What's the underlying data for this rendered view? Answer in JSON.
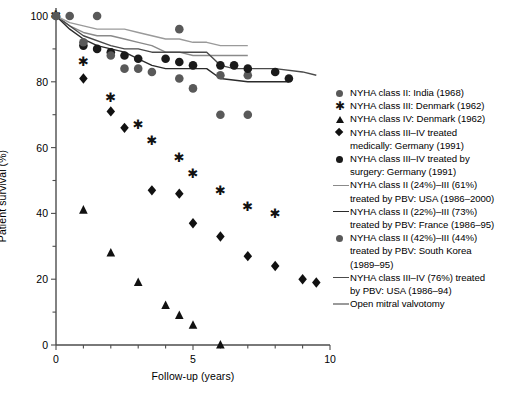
{
  "chart_data": {
    "type": "scatter",
    "title": "",
    "xlabel": "Follow-up (years)",
    "ylabel": "Patient survival (%)",
    "xlim": [
      0,
      10
    ],
    "ylim": [
      0,
      100
    ],
    "xticks": [
      0,
      5,
      10
    ],
    "yticks": [
      0,
      20,
      40,
      60,
      80,
      100
    ],
    "xminor_step": 1,
    "yminor_step": 10,
    "grid": false,
    "legend_position": "right",
    "series": [
      {
        "name": "NYHA class II: India (1968)",
        "label": "NYHA class II: India (1968)",
        "marker": "circle",
        "color": "#595959",
        "style": "markers",
        "points": [
          [
            0,
            100
          ],
          [
            0.5,
            100
          ],
          [
            1.5,
            100
          ],
          [
            4.5,
            96
          ],
          [
            6,
            82
          ],
          [
            7,
            82
          ]
        ]
      },
      {
        "name": "NYHA class III: Denmark (1962)",
        "label": "NYHA class III: Denmark (1962)",
        "marker": "star",
        "color": "#111111",
        "style": "markers",
        "points": [
          [
            0,
            100
          ],
          [
            1,
            86
          ],
          [
            2,
            75
          ],
          [
            3,
            67
          ],
          [
            3.5,
            62
          ],
          [
            4.5,
            57
          ],
          [
            5,
            52
          ],
          [
            6,
            47
          ],
          [
            7,
            42
          ],
          [
            8,
            40
          ]
        ]
      },
      {
        "name": "NYHA class IV: Denmark (1962)",
        "label": "NYHA class IV: Denmark (1962)",
        "marker": "triangle",
        "color": "#111111",
        "style": "markers",
        "points": [
          [
            1,
            41
          ],
          [
            2,
            28
          ],
          [
            3,
            19
          ],
          [
            4,
            12
          ],
          [
            4.5,
            9
          ],
          [
            5,
            6
          ],
          [
            6,
            0
          ]
        ]
      },
      {
        "name": "NYHA class III-IV treated medically: Germany (1991)",
        "label": "NYHA class III–IV treated\nmedically: Germany (1991)",
        "marker": "diamond",
        "color": "#111111",
        "style": "markers",
        "points": [
          [
            1,
            81
          ],
          [
            2,
            71
          ],
          [
            2.5,
            66
          ],
          [
            3.5,
            47
          ],
          [
            4.5,
            46
          ],
          [
            5,
            37
          ],
          [
            6,
            33
          ],
          [
            7,
            27
          ],
          [
            8,
            24
          ],
          [
            9,
            20
          ],
          [
            9.5,
            19
          ]
        ]
      },
      {
        "name": "NYHA class III-IV treated by surgery: Germany (1991)",
        "label": "NYHA class III–IV treated by\nsurgery: Germany (1991)",
        "marker": "circle",
        "color": "#1a1a1a",
        "style": "markers",
        "points": [
          [
            1,
            91
          ],
          [
            1.5,
            90
          ],
          [
            2,
            89
          ],
          [
            2.5,
            88
          ],
          [
            3,
            87
          ],
          [
            4,
            87
          ],
          [
            4.5,
            86
          ],
          [
            5,
            85
          ],
          [
            6,
            85
          ],
          [
            6.5,
            85
          ],
          [
            7,
            84
          ],
          [
            8,
            83
          ],
          [
            8.5,
            81
          ]
        ]
      },
      {
        "name": "NYHA class II (24%)-III (61%) treated by PBV: USA (1986-2000)",
        "label": "NYHA class II (24%)–III (61%)\ntreated by PBV: USA (1986–2000)",
        "marker": "line",
        "color": "#8a8a8a",
        "style": "line",
        "points": [
          [
            0,
            100
          ],
          [
            0.5,
            97
          ],
          [
            1,
            95
          ],
          [
            1.5,
            94
          ],
          [
            2,
            94
          ],
          [
            2.5,
            93
          ],
          [
            3,
            92
          ],
          [
            3.5,
            91
          ],
          [
            4,
            89
          ],
          [
            4.5,
            89
          ],
          [
            5,
            88
          ],
          [
            5.5,
            88
          ],
          [
            6,
            88
          ],
          [
            6.5,
            88
          ],
          [
            7,
            88
          ]
        ]
      },
      {
        "name": "NYHA class II (22%)-III (73%) treated by PBV: France (1986-95)",
        "label": "NYHA class II (22%)–III (73%)\ntreated by PBV: France (1986–95)",
        "marker": "line",
        "color": "#2b2b2b",
        "style": "line",
        "points": [
          [
            0,
            100
          ],
          [
            0.5,
            96
          ],
          [
            1,
            93
          ],
          [
            1.5,
            91
          ],
          [
            2,
            90
          ],
          [
            2.5,
            89
          ],
          [
            3,
            87
          ],
          [
            3.5,
            85
          ],
          [
            4,
            84
          ],
          [
            4.5,
            84
          ],
          [
            5,
            84
          ],
          [
            5.5,
            84
          ],
          [
            6,
            81
          ],
          [
            7,
            80
          ],
          [
            8,
            80
          ],
          [
            8.5,
            80
          ]
        ]
      },
      {
        "name": "NYHA class II (42%)-III (44%) treated by PBV: South Korea (1989-95)",
        "label": "NYHA class II (42%)–III (44%)\ntreated by PBV: South Korea\n(1989–95)",
        "marker": "circle",
        "color": "#595959",
        "style": "markers",
        "points": [
          [
            0,
            100
          ],
          [
            1,
            92
          ],
          [
            2,
            88
          ],
          [
            2.5,
            84
          ],
          [
            3,
            84
          ],
          [
            3.5,
            83
          ],
          [
            4.5,
            81
          ],
          [
            5,
            78
          ],
          [
            6,
            70
          ],
          [
            7,
            70
          ]
        ]
      },
      {
        "name": "NYHA class III-IV (76%) treated by PBV: USA (1986-94)",
        "label": "NYHA class III–IV (76%) treated\nby PBV: USA (1986–94)",
        "marker": "line",
        "color": "#4a4a4a",
        "style": "line",
        "points": [
          [
            0,
            100
          ],
          [
            1,
            94
          ],
          [
            2,
            91
          ],
          [
            2.5,
            90
          ],
          [
            3,
            90
          ],
          [
            3.5,
            89
          ],
          [
            4,
            89
          ],
          [
            4.5,
            89
          ],
          [
            5,
            89
          ],
          [
            5.5,
            89
          ],
          [
            6,
            85
          ],
          [
            6.5,
            84
          ],
          [
            7,
            84
          ],
          [
            8,
            84
          ],
          [
            9,
            83
          ],
          [
            9.5,
            82
          ]
        ]
      },
      {
        "name": "Open mitral valvotomy",
        "label": "Open mitral valvotomy",
        "marker": "line",
        "color": "#9a9a9a",
        "style": "line",
        "points": [
          [
            0,
            100
          ],
          [
            0.5,
            98
          ],
          [
            1,
            97
          ],
          [
            1.5,
            96
          ],
          [
            2,
            96
          ],
          [
            2.5,
            96
          ],
          [
            3,
            95
          ],
          [
            3.5,
            94
          ],
          [
            4,
            93
          ],
          [
            4.5,
            93
          ],
          [
            5,
            92
          ],
          [
            5.5,
            92
          ],
          [
            6,
            91
          ],
          [
            6.5,
            91
          ],
          [
            7,
            91
          ]
        ]
      }
    ]
  },
  "axes": {
    "y_title": "Patient survival (%)",
    "x_title": "Follow-up (years)",
    "y_ticks": [
      "100",
      "80",
      "60",
      "40",
      "20",
      "0"
    ],
    "x_ticks": [
      "0",
      "5",
      "10"
    ]
  },
  "legend": {
    "items": [
      {
        "key": "circle-marker-gray",
        "label": "NYHA class II: India (1968)"
      },
      {
        "key": "star-marker-black",
        "label": "NYHA class III: Denmark (1962)"
      },
      {
        "key": "triangle-marker-black",
        "label": "NYHA class IV: Denmark (1962)"
      },
      {
        "key": "diamond-marker-black",
        "label": "NYHA class III–IV treated\nmedically: Germany (1991)"
      },
      {
        "key": "circle-marker-black",
        "label": "NYHA class III–IV treated by\nsurgery: Germany (1991)"
      },
      {
        "key": "line-light-gray",
        "label": "NYHA class II (24%)–III (61%)\ntreated by PBV: USA (1986–2000)"
      },
      {
        "key": "line-dark",
        "label": "NYHA class II (22%)–III (73%)\ntreated by PBV: France (1986–95)"
      },
      {
        "key": "circle-marker-gray",
        "label": "NYHA class II (42%)–III (44%)\ntreated by PBV: South Korea\n(1989–95)"
      },
      {
        "key": "line-medium-dark",
        "label": "NYHA class III–IV (76%) treated\nby PBV: USA (1986–94)"
      },
      {
        "key": "line-pale-gray",
        "label": "Open mitral valvotomy"
      }
    ]
  },
  "colors": {
    "axis": "#4d4d4d",
    "marker_gray": "#595959",
    "marker_black": "#111111",
    "line_light": "#8a8a8a",
    "line_dark": "#2b2b2b",
    "background": "#ffffff"
  }
}
